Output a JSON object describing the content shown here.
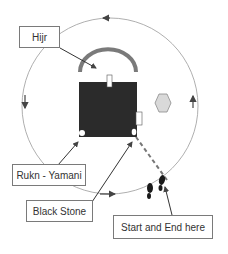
{
  "diagram": {
    "labels": {
      "hijr": "Hijr",
      "rukn_yamani": "Rukn - Yamani",
      "black_stone": "Black Stone",
      "start_end": "Start and End here"
    },
    "direction": "counter-clockwise",
    "colors": {
      "kaaba": "#2b2b2b",
      "hijr_arc": "#7a7a7a",
      "circle": "#9a9a9a",
      "hexagon_fill": "#d9d9d9",
      "hexagon_stroke": "#8a8a8a",
      "dashed_path": "#777777",
      "box_border": "#7a7a7a",
      "text": "#333333"
    },
    "icons": {
      "footprints": "footprints-icon",
      "maqam_ibrahim": "hexagon-icon"
    }
  }
}
